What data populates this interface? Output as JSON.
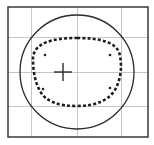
{
  "diagram": {
    "type": "lens-tracing",
    "canvas": {
      "width": 154,
      "height": 145,
      "background": "#ffffff"
    },
    "frame": {
      "x": 8,
      "y": 7,
      "width": 140,
      "height": 130,
      "stroke": "#3a3a3a",
      "stroke_width": 1.5
    },
    "gridlines": {
      "stroke": "#b8b8b8",
      "vertical_x": [
        31,
        77,
        121
      ],
      "horizontal_y": [
        37,
        72,
        106
      ]
    },
    "lens_blank_circle": {
      "cx": 77,
      "cy": 72,
      "r": 57,
      "stroke": "#2a2a2a",
      "stroke_width": 1.3
    },
    "frame_shape_outline": {
      "style": "dashed",
      "stroke": "#1e1e1e",
      "stroke_width": 2.6,
      "dasharray": "3,2.2",
      "path": "M 77 38 C 100 38, 118 42, 120 56 C 122 66, 121 78, 116 88 C 110 100, 96 106, 77 106 C 58 106, 45 101, 40 91 C 34 80, 33 68, 33 58 C 34 43, 52 38, 77 38 Z"
    },
    "optical_center_cross": {
      "cx": 63,
      "cy": 72,
      "arm": 9,
      "stroke": "#2a2a2a",
      "stroke_width": 1.4
    },
    "reference_dots": [
      {
        "cx": 45,
        "cy": 55,
        "r": 1.3
      },
      {
        "cx": 110,
        "cy": 55,
        "r": 1.3
      },
      {
        "cx": 43,
        "cy": 89,
        "r": 1.3
      },
      {
        "cx": 110,
        "cy": 88,
        "r": 1.3
      }
    ]
  }
}
